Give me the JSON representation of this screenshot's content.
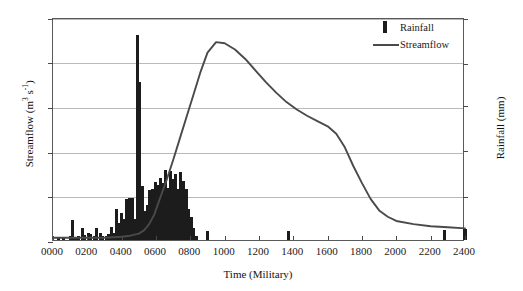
{
  "chart_data": {
    "type": "bar",
    "title": "",
    "xlabel": "Time (Military)",
    "ylabel": "Streamflow (m3 s-1)",
    "ylabel_right": "Rainfall (mm)",
    "xlim": [
      0,
      2400
    ],
    "ylim_left": [
      0,
      212
    ],
    "ylim_right": [
      0,
      10.0
    ],
    "grid": true,
    "legend_position": "top-right",
    "x_ticks": [
      "0000",
      "0200",
      "0400",
      "0600",
      "0800",
      "1000",
      "1200",
      "1400",
      "1600",
      "1800",
      "2000",
      "2200",
      "2400"
    ],
    "x_tick_values": [
      0,
      200,
      400,
      600,
      800,
      1000,
      1200,
      1400,
      1600,
      1800,
      2000,
      2200,
      2400
    ],
    "y_ticks_left": [
      "0",
      "43",
      "85",
      "127",
      "170",
      "212"
    ],
    "y_tick_values_left": [
      0,
      43,
      85,
      127,
      170,
      212
    ],
    "y_ticks_right": [
      "0",
      "2.0",
      "4.1",
      "6.1",
      "8.0",
      "10.0"
    ],
    "y_tick_values_right": [
      0,
      2.0,
      4.1,
      6.1,
      8.0,
      10.0
    ],
    "series": [
      {
        "name": "Rainfall",
        "type": "bar",
        "axis": "right",
        "unit": "mm",
        "color": "#1c1c1c",
        "x": [
          30,
          60,
          100,
          115,
          130,
          150,
          170,
          185,
          205,
          220,
          240,
          255,
          275,
          290,
          310,
          325,
          340,
          355,
          370,
          385,
          400,
          415,
          430,
          445,
          460,
          475,
          490,
          505,
          520,
          535,
          550,
          565,
          580,
          595,
          610,
          625,
          640,
          655,
          670,
          685,
          700,
          715,
          730,
          745,
          760,
          775,
          790,
          805,
          820,
          835,
          900,
          1370,
          2280,
          2400
        ],
        "values": [
          0.12,
          0.1,
          0.2,
          0.9,
          0.15,
          0.18,
          0.55,
          0.22,
          0.3,
          0.26,
          0.2,
          0.55,
          0.3,
          0.2,
          0.18,
          0.25,
          0.6,
          0.32,
          1.4,
          0.75,
          1.2,
          0.95,
          1.85,
          1.9,
          1.9,
          0.95,
          9.2,
          7.1,
          2.4,
          1.3,
          1.55,
          2.25,
          2.3,
          2.6,
          2.45,
          2.8,
          2.55,
          3.15,
          2.35,
          3.1,
          2.75,
          2.95,
          2.3,
          3.05,
          2.65,
          2.3,
          1.4,
          1.05,
          0.55,
          0.18,
          0.42,
          0.4,
          0.45,
          0.5
        ]
      },
      {
        "name": "Streamflow",
        "type": "line",
        "axis": "left",
        "unit": "m3 s-1",
        "color": "#4a4a4a",
        "x": [
          0,
          100,
          200,
          300,
          400,
          450,
          500,
          530,
          560,
          590,
          620,
          660,
          700,
          740,
          780,
          820,
          860,
          900,
          950,
          1000,
          1060,
          1120,
          1180,
          1240,
          1300,
          1360,
          1420,
          1480,
          1540,
          1600,
          1650,
          1700,
          1750,
          1800,
          1850,
          1900,
          1950,
          2000,
          2100,
          2200,
          2300,
          2400
        ],
        "values": [
          4,
          4,
          4,
          4,
          5,
          6,
          8,
          11,
          17,
          26,
          40,
          58,
          78,
          99,
          120,
          141,
          162,
          180,
          190,
          189,
          183,
          174,
          163,
          152,
          142,
          133,
          126,
          120,
          115,
          110,
          103,
          90,
          72,
          56,
          41,
          30,
          24,
          20,
          17,
          15,
          14,
          13
        ]
      }
    ]
  },
  "legend": {
    "items": [
      {
        "label": "Rainfall",
        "marker": "bar"
      },
      {
        "label": "Streamflow",
        "marker": "line"
      }
    ]
  }
}
